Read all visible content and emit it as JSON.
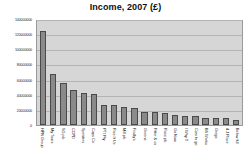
{
  "chart_data": {
    "type": "bar",
    "title": "Income, 2007 (£)",
    "xlabel": "",
    "ylabel": "",
    "ylim": [
      0,
      140000000
    ],
    "grid": true,
    "legend": false,
    "y_ticks": [
      0,
      20000000,
      40000000,
      60000000,
      80000000,
      100000000,
      120000000,
      140000000
    ],
    "y_tick_labels": [
      "0",
      "20000000",
      "40000000",
      "60000000",
      "80000000",
      "100000000",
      "120000000",
      "140000000"
    ],
    "categories": [
      "HPN Group",
      "My Tours",
      "SG plc",
      "CCPD",
      "Sprinters",
      "Cups Co",
      "PTI Pty",
      "Rise It Us",
      "Mill plc",
      "Findly's",
      "Greens",
      "Fitter & co",
      "Ross plc",
      "Go Now",
      "I Why T",
      "Cars to go",
      "BS Works",
      "Gregs",
      "4 J Place",
      "Below ltd"
    ],
    "values": [
      124000000,
      67000000,
      56000000,
      46000000,
      42000000,
      41500000,
      27000000,
      26000000,
      24000000,
      22000000,
      17500000,
      17000000,
      15500000,
      13500000,
      12500000,
      12500000,
      9500000,
      9500000,
      9000000,
      6000000
    ]
  },
  "colors": {
    "bar_fill": "#8a8a8a",
    "bar_outline": "#4a4a4a",
    "plot_background": "#d6d6d6",
    "gridline": "#b4b4b4",
    "title_text": "#111111",
    "page_background": "#ffffff"
  }
}
